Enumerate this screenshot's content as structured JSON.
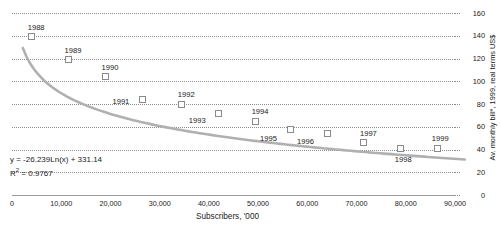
{
  "chart_data": {
    "type": "scatter",
    "title": "",
    "xlabel": "Subscribers, '000",
    "ylabel": "Av. monthly bill*, 1999, real terms US$",
    "xlim": [
      0,
      90000
    ],
    "ylim": [
      0,
      160
    ],
    "grid": true,
    "legend": null,
    "x_ticks": [
      "0",
      "10,000",
      "20,000",
      "30,000",
      "40,000",
      "50,000",
      "60,000",
      "70,000",
      "80,000",
      "90,000"
    ],
    "x_tick_values": [
      0,
      10000,
      20000,
      30000,
      40000,
      50000,
      60000,
      70000,
      80000,
      90000
    ],
    "y_ticks": [
      "0",
      "20",
      "40",
      "60",
      "80",
      "100",
      "120",
      "140",
      "160"
    ],
    "y_tick_values": [
      0,
      20,
      40,
      60,
      80,
      100,
      120,
      140,
      160
    ],
    "point_labels": [
      "1988",
      "1989",
      "1990",
      "1991",
      "1992",
      "1993",
      "1994",
      "1995",
      "1996",
      "1997",
      "1998",
      "1999"
    ],
    "x": [
      4000,
      11500,
      19000,
      26500,
      34500,
      42000,
      49500,
      56500,
      64000,
      71500,
      79000,
      86500
    ],
    "values": [
      139,
      119,
      104,
      84,
      80,
      72,
      65,
      58,
      54,
      46,
      41,
      41
    ],
    "label_offsets": [
      {
        "dx": -4,
        "dy": -13
      },
      {
        "dx": -4,
        "dy": -13
      },
      {
        "dx": -4,
        "dy": -13
      },
      {
        "dx": -30,
        "dy": -1
      },
      {
        "dx": -4,
        "dy": -13
      },
      {
        "dx": -30,
        "dy": 4
      },
      {
        "dx": -4,
        "dy": -13
      },
      {
        "dx": -30,
        "dy": 6
      },
      {
        "dx": -30,
        "dy": 4
      },
      {
        "dx": -4,
        "dy": -13
      },
      {
        "dx": -6,
        "dy": 8
      },
      {
        "dx": -6,
        "dy": -13
      }
    ],
    "annotations": {
      "equation": "y  =  -26.239Ln(x) + 331.14",
      "r_squared_label": "R",
      "r_squared_sup": "2",
      "r_squared_value": "=  0.9767"
    },
    "trendline": {
      "type": "logarithmic",
      "coefficient": -26.239,
      "intercept": 331.14,
      "r_squared": 0.9767,
      "color": "#b0b0b0"
    },
    "colors": {
      "marker_fill": "#ffffff",
      "marker_border": "#8a8a8a",
      "gridline": "#8c8c8c",
      "axis": "#9a9a9a",
      "text": "#1a1a1a"
    }
  }
}
